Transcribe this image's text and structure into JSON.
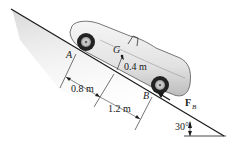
{
  "diagram": {
    "type": "engineering-mechanics-figure",
    "points": {
      "A": "A",
      "B": "B",
      "G": "G"
    },
    "dimensions": {
      "a_to_g": "0.8 m",
      "g_to_b": "1.2 m",
      "g_height": "0.4 m"
    },
    "force": {
      "label_main": "F",
      "label_sub": "B"
    },
    "angle": "30°",
    "colors": {
      "line": "#1a1a1a",
      "shade": "#d8d8d8",
      "car_body": "#ececec",
      "tire": "#222222"
    }
  }
}
